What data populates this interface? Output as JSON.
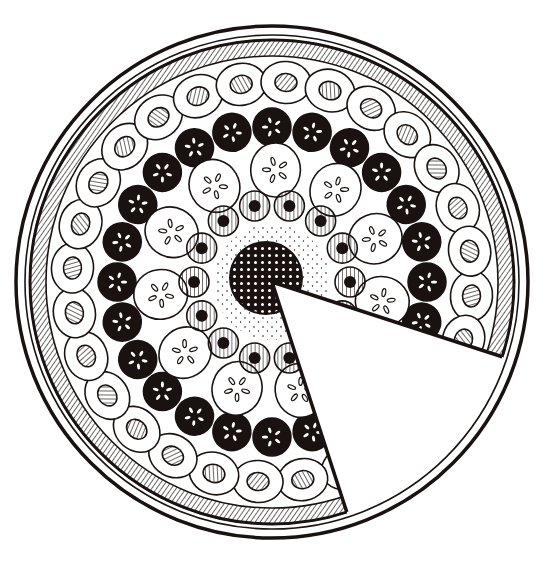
{
  "illustration": {
    "subject": "Fruit tart with one slice removed",
    "style": "black ink line drawing",
    "colors": {
      "ink": "#1a1210",
      "paper": "#ffffff",
      "cream": "#fbf9f6"
    },
    "geometry": {
      "center": [
        272,
        282
      ],
      "plate_radius": 256,
      "plate_inner_radius": 247,
      "crust_outer_radius": 242,
      "crust_inner_radius": 226,
      "slice_start_angle_deg": 18,
      "slice_end_angle_deg": 72
    },
    "rings": [
      {
        "name": "outer-fruit-ring",
        "radius": 200,
        "count": 28,
        "kind": "white oval with hatched center",
        "rx": 25,
        "ry": 21
      },
      {
        "name": "dark-fruit-ring",
        "radius": 155,
        "count": 24,
        "kind": "black slice with white seed marks",
        "r": 19
      },
      {
        "name": "pale-fruit-ring",
        "radius": 112,
        "count": 11,
        "kind": "white slice with petal seed marks",
        "r": 27
      },
      {
        "name": "hatched-fruit-ring",
        "radius": 78,
        "count": 14,
        "kind": "hatched ring with black dot",
        "r": 15
      },
      {
        "name": "cream-filling",
        "radius": 58,
        "kind": "dotted cream"
      },
      {
        "name": "berry-cluster",
        "radius": 36,
        "kind": "black berry cluster"
      }
    ]
  }
}
